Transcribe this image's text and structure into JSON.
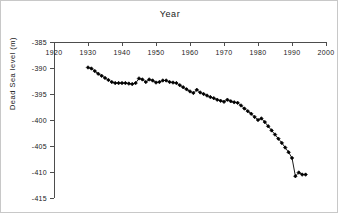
{
  "figure": {
    "title": "Year",
    "ylabel": "Dead Sea level (m)",
    "background": "#ffffff",
    "axis_color": "#4d4d4d",
    "series_color": "#000000"
  },
  "chart_data": {
    "type": "line",
    "title": "Year",
    "xlabel": "Year",
    "ylabel": "Dead Sea level (m)",
    "xlim": [
      1920,
      2000
    ],
    "ylim": [
      -415,
      -385
    ],
    "xticks": [
      1920,
      1930,
      1940,
      1950,
      1960,
      1970,
      1980,
      1990,
      2000
    ],
    "yticks": [
      -385,
      -390,
      -395,
      -400,
      -405,
      -410,
      -415
    ],
    "xtick_labels": [
      "1920",
      "1930",
      "1940",
      "1950",
      "1960",
      "1970",
      "1980",
      "1990",
      "2000"
    ],
    "ytick_labels": [
      "-385",
      "-390",
      "-395",
      "-400",
      "-405",
      "-410",
      "-415"
    ],
    "xaxis_position": "top",
    "yaxis_position": "left",
    "grid": false,
    "legend": false,
    "marker": "filled-diamond",
    "series": [
      {
        "name": "Dead Sea level",
        "x": [
          1930,
          1931,
          1932,
          1933,
          1934,
          1935,
          1936,
          1937,
          1938,
          1939,
          1940,
          1941,
          1942,
          1943,
          1944,
          1945,
          1946,
          1947,
          1948,
          1949,
          1950,
          1951,
          1952,
          1953,
          1954,
          1955,
          1956,
          1957,
          1958,
          1959,
          1960,
          1961,
          1962,
          1963,
          1964,
          1965,
          1966,
          1967,
          1968,
          1969,
          1970,
          1971,
          1972,
          1973,
          1974,
          1975,
          1976,
          1977,
          1978,
          1979,
          1980,
          1981,
          1982,
          1983,
          1984,
          1985,
          1986,
          1987,
          1988,
          1989,
          1990,
          1991,
          1992,
          1993,
          1994
        ],
        "values": [
          -389.9,
          -390.1,
          -390.6,
          -391.1,
          -391.5,
          -391.9,
          -392.3,
          -392.7,
          -392.9,
          -392.9,
          -392.9,
          -392.9,
          -393.0,
          -393.1,
          -392.9,
          -392.0,
          -392.2,
          -392.7,
          -392.2,
          -392.4,
          -392.8,
          -392.7,
          -392.4,
          -392.4,
          -392.7,
          -392.8,
          -392.9,
          -393.3,
          -393.7,
          -394.1,
          -394.5,
          -394.8,
          -394.2,
          -394.7,
          -395.0,
          -395.3,
          -395.6,
          -395.8,
          -396.1,
          -396.3,
          -396.5,
          -396.1,
          -396.4,
          -396.6,
          -396.7,
          -397.2,
          -397.8,
          -398.3,
          -398.8,
          -399.4,
          -400.0,
          -399.7,
          -400.4,
          -401.2,
          -402.0,
          -402.8,
          -403.6,
          -404.4,
          -405.3,
          -406.2,
          -407.3,
          -410.8,
          -410.1,
          -410.5,
          -410.5
        ],
        "ymin_point": -410.8,
        "ymax_point": -389.9
      }
    ]
  }
}
